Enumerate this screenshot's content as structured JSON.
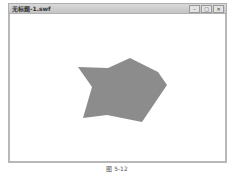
{
  "window": {
    "title": "无标题-1.swf",
    "controls": [
      {
        "name": "minimize",
        "glyph": "–"
      },
      {
        "name": "maximize",
        "glyph": "□"
      },
      {
        "name": "close",
        "glyph": "✕"
      }
    ]
  },
  "stage": {
    "background": "#ffffff",
    "shape": {
      "fill": "#8c8c8c",
      "points": "78,67 92,87 83,118 107,115 142,122 167,85 158,72 130,58 108,68"
    }
  },
  "caption": "图 5-12"
}
